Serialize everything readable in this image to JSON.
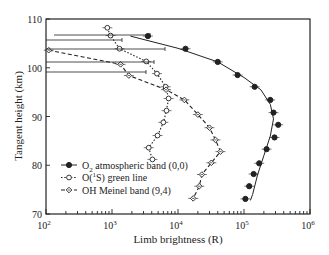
{
  "chart_data": {
    "type": "scatter",
    "title": "",
    "xlabel": "Limb brightness (R)",
    "ylabel": "Tangent height (km)",
    "xscale": "log",
    "xlim": [
      100,
      1000000
    ],
    "ylim": [
      70,
      110
    ],
    "x_ticks": [
      "10^2",
      "10^3",
      "10^4",
      "10^5",
      "10^6"
    ],
    "y_ticks": [
      70,
      80,
      90,
      100,
      110
    ],
    "grid": false,
    "legend_position": "lower left",
    "series": [
      {
        "name": "O2 atmospheric band (0,0)",
        "marker": "filled-circle",
        "line": "solid",
        "points": [
          {
            "x": 3500,
            "y": 106.5
          },
          {
            "x": 13000,
            "y": 103.9
          },
          {
            "x": 40000,
            "y": 101.2
          },
          {
            "x": 80000,
            "y": 98.5
          },
          {
            "x": 145000,
            "y": 96.1
          },
          {
            "x": 250000,
            "y": 93.4
          },
          {
            "x": 280000,
            "y": 90.8
          },
          {
            "x": 330000,
            "y": 88.3
          },
          {
            "x": 290000,
            "y": 85.7
          },
          {
            "x": 220000,
            "y": 83.3
          },
          {
            "x": 170000,
            "y": 80.4
          },
          {
            "x": 140000,
            "y": 78.2
          },
          {
            "x": 120000,
            "y": 75.7
          },
          {
            "x": 105000,
            "y": 73.1
          }
        ],
        "fit_line": [
          {
            "x": 1900,
            "y": 106.5
          },
          {
            "x": 10000,
            "y": 104.0
          },
          {
            "x": 40000,
            "y": 101.2
          },
          {
            "x": 100000,
            "y": 98.0
          },
          {
            "x": 180000,
            "y": 95.5
          },
          {
            "x": 250000,
            "y": 92.5
          },
          {
            "x": 280000,
            "y": 89.5
          },
          {
            "x": 250000,
            "y": 86.0
          },
          {
            "x": 200000,
            "y": 82.0
          },
          {
            "x": 160000,
            "y": 78.0
          },
          {
            "x": 135000,
            "y": 74.0
          },
          {
            "x": 125000,
            "y": 72.8
          }
        ]
      },
      {
        "name": "O(1S) green line",
        "marker": "open-circle",
        "line": "dotted",
        "points": [
          {
            "x": 850,
            "y": 108.2
          },
          {
            "x": 950,
            "y": 106.6
          },
          {
            "x": 1300,
            "y": 103.9
          },
          {
            "x": 3300,
            "y": 101.3
          },
          {
            "x": 4800,
            "y": 98.8
          },
          {
            "x": 6500,
            "y": 96.1
          },
          {
            "x": 7200,
            "y": 93.7
          },
          {
            "x": 6700,
            "y": 91.2
          },
          {
            "x": 6000,
            "y": 88.8
          },
          {
            "x": 4900,
            "y": 86.1
          },
          {
            "x": 3600,
            "y": 83.6
          },
          {
            "x": 4100,
            "y": 81.2
          }
        ]
      },
      {
        "name": "OH Meinel band (9,4)",
        "marker": "open-diamond",
        "line": "dashed",
        "points": [
          {
            "x": 110,
            "y": 103.6
          },
          {
            "x": 1350,
            "y": 100.7
          },
          {
            "x": 1800,
            "y": 98.4
          },
          {
            "x": 6600,
            "y": 95.5
          },
          {
            "x": 12500,
            "y": 93.4
          },
          {
            "x": 20000,
            "y": 90.4
          },
          {
            "x": 30000,
            "y": 87.7
          },
          {
            "x": 37000,
            "y": 85.2
          },
          {
            "x": 44000,
            "y": 82.8
          },
          {
            "x": 32000,
            "y": 80.5
          },
          {
            "x": 23000,
            "y": 78.1
          },
          {
            "x": 21000,
            "y": 75.7
          },
          {
            "x": 17000,
            "y": 73.2
          }
        ]
      }
    ]
  },
  "axes": {
    "xlabel": "Limb brightness (R)",
    "ylabel": "Tangent height (km)",
    "x_tick_labels": [
      {
        "base": "10",
        "exp": "2"
      },
      {
        "base": "10",
        "exp": "3"
      },
      {
        "base": "10",
        "exp": "4"
      },
      {
        "base": "10",
        "exp": "5"
      },
      {
        "base": "10",
        "exp": "6"
      }
    ],
    "y_tick_labels": [
      "110",
      "100",
      "90",
      "80",
      "70"
    ]
  },
  "legend": {
    "items": [
      {
        "pre": "O",
        "sub": "2",
        "post": " atmospheric band (0,0)"
      },
      {
        "pre": "O(",
        "sup": "1",
        "post": "S) green line"
      },
      {
        "pre": "OH Meinel band (9,4)"
      }
    ]
  }
}
